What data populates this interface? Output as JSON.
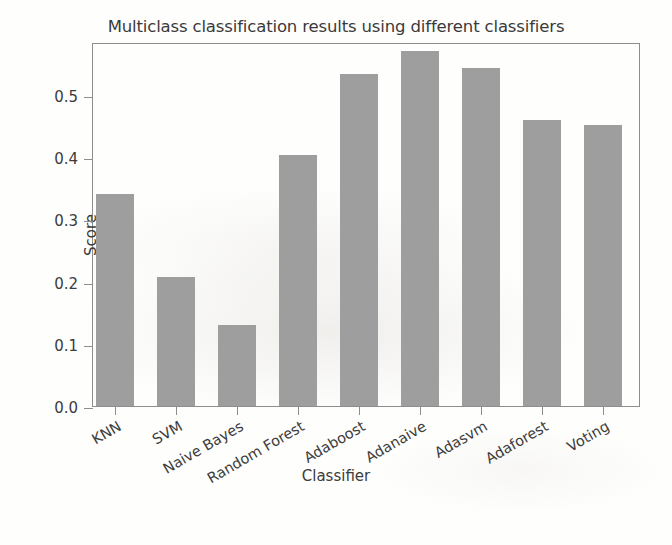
{
  "chart_data": {
    "type": "bar",
    "title": "Multiclass classification results using different classifiers",
    "xlabel": "Classifier",
    "ylabel": "Score",
    "categories": [
      "KNN",
      "SVM",
      "Naive Bayes",
      "Random Forest",
      "Adaboost",
      "Adanaive",
      "Adasvm",
      "Adaforest",
      "Voting"
    ],
    "values": [
      0.341,
      0.208,
      0.131,
      0.403,
      0.533,
      0.57,
      0.543,
      0.459,
      0.452
    ],
    "ylim": [
      0.0,
      0.585
    ],
    "yticks": [
      "0.0",
      "0.1",
      "0.2",
      "0.3",
      "0.4",
      "0.5"
    ],
    "ytick_values": [
      0.0,
      0.1,
      0.2,
      0.3,
      0.4,
      0.5
    ],
    "grid": false,
    "legend": "none",
    "bar_color": "#9e9e9e",
    "axis_color": "#8d8d8d",
    "text_color": "#3c3c3c",
    "xtick_rotation_deg": -30
  }
}
